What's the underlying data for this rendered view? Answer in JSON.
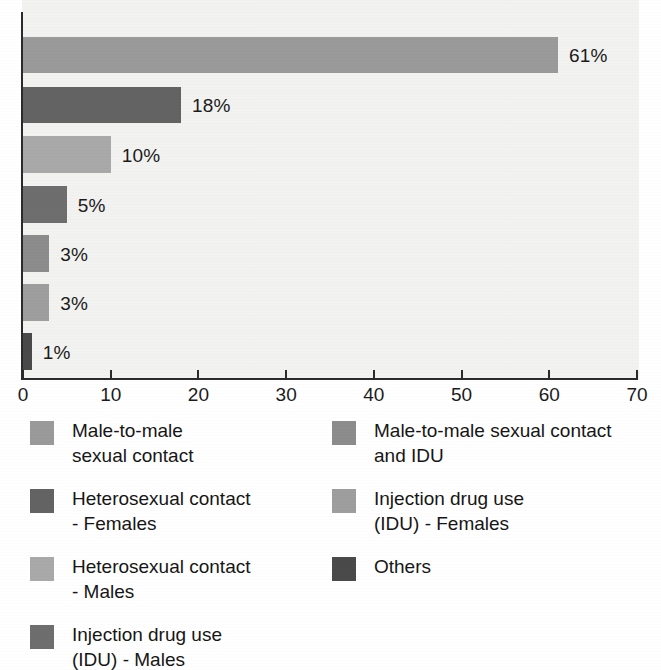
{
  "chart_data": {
    "type": "bar",
    "orientation": "horizontal",
    "title": "",
    "subtitle": "",
    "xlabel": "",
    "ylabel": "",
    "xlim": [
      0,
      70
    ],
    "xticks": [
      0,
      10,
      20,
      30,
      40,
      50,
      60,
      70
    ],
    "xtick_labels": [
      "0",
      "10",
      "20",
      "30",
      "40",
      "50",
      "60",
      "70"
    ],
    "grid": false,
    "legend_position": "below-two-columns",
    "categories": [
      "Male-to-male sexual contact",
      "Heterosexual contact - Females",
      "Heterosexual contact - Males",
      "Injection drug use (IDU) - Males",
      "Male-to-male sexual contact and IDU",
      "Injection drug use (IDU) - Females",
      "Others"
    ],
    "values": [
      61,
      18,
      10,
      5,
      3,
      3,
      1
    ],
    "data_labels": [
      "61%",
      "18%",
      "10%",
      "5%",
      "3%",
      "3%",
      "1%"
    ],
    "bar_colors": [
      "#9a9a9a",
      "#636363",
      "#a9a9a9",
      "#6e6e6e",
      "#8c8c8c",
      "#9e9e9e",
      "#4a4a4a"
    ],
    "axis_color": "#2b2b2b",
    "plot_background": "#f2f2f0"
  },
  "bars": [
    {
      "label": "61%",
      "value": 61,
      "color": "#9a9a9a",
      "top": 37,
      "height": 36
    },
    {
      "label": "18%",
      "value": 18,
      "color": "#636363",
      "top": 87,
      "height": 36
    },
    {
      "label": "10%",
      "value": 10,
      "color": "#a9a9a9",
      "top": 136,
      "height": 37
    },
    {
      "label": "5%",
      "value": 5,
      "color": "#6e6e6e",
      "top": 186,
      "height": 37
    },
    {
      "label": "3%",
      "value": 3,
      "color": "#8c8c8c",
      "top": 235,
      "height": 37
    },
    {
      "label": "3%",
      "value": 3,
      "color": "#9e9e9e",
      "top": 284,
      "height": 37
    },
    {
      "label": "1%",
      "value": 1,
      "color": "#4a4a4a",
      "top": 333,
      "height": 37
    }
  ],
  "legend": {
    "columns": [
      {
        "items": [
          {
            "swatch_color": "#9a9a9a",
            "label": "Male-to-male\nsexual contact",
            "icon": "legend-swatch-icon"
          },
          {
            "swatch_color": "#636363",
            "label": "Heterosexual contact\n- Females",
            "icon": "legend-swatch-icon"
          },
          {
            "swatch_color": "#a9a9a9",
            "label": "Heterosexual contact\n- Males",
            "icon": "legend-swatch-icon"
          },
          {
            "swatch_color": "#6e6e6e",
            "label": "Injection drug use\n(IDU) - Males",
            "icon": "legend-swatch-icon"
          }
        ]
      },
      {
        "items": [
          {
            "swatch_color": "#8c8c8c",
            "label": "Male-to-male sexual contact\nand IDU",
            "icon": "legend-swatch-icon"
          },
          {
            "swatch_color": "#9e9e9e",
            "label": "Injection drug use\n(IDU) - Females",
            "icon": "legend-swatch-icon"
          },
          {
            "swatch_color": "#4a4a4a",
            "label": "Others",
            "icon": "legend-swatch-icon"
          }
        ]
      }
    ]
  }
}
